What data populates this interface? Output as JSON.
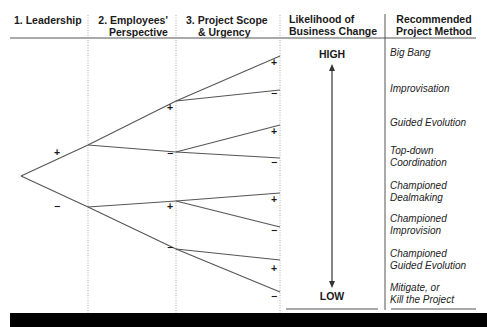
{
  "headers": {
    "leadership": "1. Leadership",
    "employees_line1": "2. Employees'",
    "employees_line2": "Perspective",
    "scope_line1": "3. Project Scope",
    "scope_line2": "& Urgency",
    "likelihood_line1": "Likelihood of",
    "likelihood_line2": "Business Change",
    "method_line1": "Recommended",
    "method_line2": "Project Method"
  },
  "likelihood": {
    "high": "HIGH",
    "low": "LOW"
  },
  "signs": {
    "plus": "+",
    "minus": "−"
  },
  "methods": [
    {
      "line1": "Big Bang",
      "line2": ""
    },
    {
      "line1": "Improvisation",
      "line2": ""
    },
    {
      "line1": "Guided Evolution",
      "line2": ""
    },
    {
      "line1": "Top-down",
      "line2": "Coordination"
    },
    {
      "line1": "Championed",
      "line2": "Dealmaking"
    },
    {
      "line1": "Championed",
      "line2": "Improvision"
    },
    {
      "line1": "Championed",
      "line2": "Guided Evolution"
    },
    {
      "line1": "Mitigate, or",
      "line2": "Kill the Project"
    }
  ],
  "colors": {
    "line": "#555555",
    "text": "#1a1a1a",
    "bar": "#000000"
  }
}
